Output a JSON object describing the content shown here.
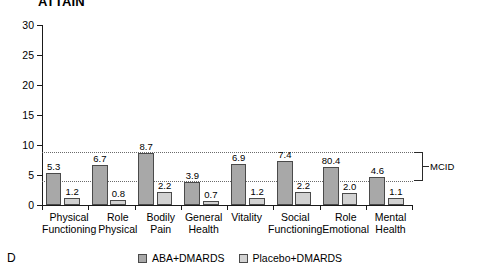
{
  "panel_letter": "D",
  "title": "ATTAIN",
  "mcid": {
    "label": "MCID",
    "lower": 4.0,
    "upper": 8.8
  },
  "legend": {
    "items": [
      {
        "label": "ABA+DMARDS",
        "color": "#a8a8a8"
      },
      {
        "label": "Placebo+DMARDS",
        "color": "#d2d2d2"
      }
    ]
  },
  "chart_data": {
    "type": "bar",
    "title": "ATTAIN",
    "xlabel": "",
    "ylabel": "",
    "ylim": [
      0,
      30
    ],
    "yticks": [
      0,
      5,
      10,
      15,
      20,
      25,
      30
    ],
    "ytick_labels": [
      "0",
      "5",
      "10",
      "15",
      "20",
      "25",
      "30"
    ],
    "grid": false,
    "legend_position": "bottom-center",
    "categories": [
      "Physical Functioning",
      "Role Physical",
      "Bodily Pain",
      "General Health",
      "Vitality",
      "Social Functioning",
      "Role Emotional",
      "Mental Health"
    ],
    "category_lines": [
      [
        "Physical",
        "Functioning"
      ],
      [
        "Role",
        "Physical"
      ],
      [
        "Bodily",
        "Pain"
      ],
      [
        "General",
        "Health"
      ],
      [
        "Vitality",
        ""
      ],
      [
        "Social",
        "Functioning"
      ],
      [
        "Role",
        "Emotional"
      ],
      [
        "Mental",
        "Health"
      ]
    ],
    "series": [
      {
        "name": "ABA+DMARDS",
        "color": "#a8a8a8",
        "values": [
          5.3,
          6.7,
          8.7,
          3.9,
          6.9,
          7.4,
          6.3,
          4.6
        ],
        "labels": [
          "5.3",
          "6.7",
          "8.7",
          "3.9",
          "6.9",
          "7.4",
          "80.4",
          "4.6"
        ]
      },
      {
        "name": "Placebo+DMARDS",
        "color": "#d2d2d2",
        "values": [
          1.2,
          0.8,
          2.2,
          0.7,
          1.2,
          2.2,
          2.0,
          1.1
        ],
        "labels": [
          "1.2",
          "0.8",
          "2.2",
          "0.7",
          "1.2",
          "2.2",
          "2.0",
          "1.1"
        ]
      }
    ],
    "annotations": [
      {
        "type": "hline",
        "value": 8.8,
        "style": "dotted",
        "label": "MCID upper"
      },
      {
        "type": "hline",
        "value": 4.0,
        "style": "dotted",
        "label": "MCID lower"
      },
      {
        "type": "bracket",
        "from": 4.0,
        "to": 8.8,
        "label": "MCID"
      }
    ]
  }
}
